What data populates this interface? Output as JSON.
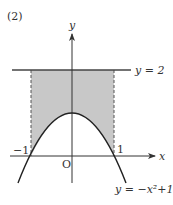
{
  "problem_label": "(2)",
  "axes": {
    "x_label": "x",
    "y_label": "y",
    "origin_label": "O"
  },
  "ticks": {
    "neg_one": "−1",
    "pos_one": "1"
  },
  "curves": {
    "line_label": "y = 2",
    "parabola_label": "y = −x²+1"
  },
  "colors": {
    "shade": "#c8c8c8",
    "stroke": "#333333"
  }
}
